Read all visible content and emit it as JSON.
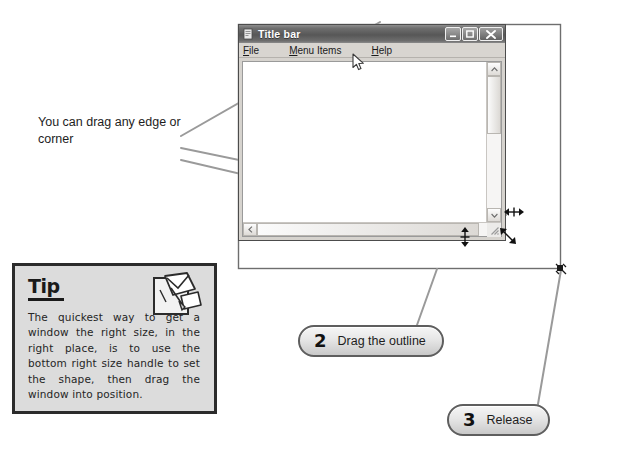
{
  "annotations": {
    "drag_note": "You can drag any edge or corner"
  },
  "window": {
    "title": "Title bar",
    "title_icon": "window-doc-icon",
    "controls": {
      "minimize": "minimize-icon",
      "maximize": "maximize-icon",
      "close": "close-icon"
    },
    "menu": [
      {
        "accel": "F",
        "rest": "ile",
        "name": "menu-file"
      },
      {
        "accel": "M",
        "rest": "enu Items",
        "name": "menu-items"
      },
      {
        "accel": "H",
        "rest": "elp",
        "name": "menu-help"
      }
    ],
    "scrollbars": {
      "vertical_up": "scroll-up-arrow",
      "vertical_down": "scroll-down-arrow",
      "horizontal_left": "scroll-left-arrow",
      "horizontal_right": "scroll-right-arrow",
      "grip": "resize-grip-icon"
    },
    "cursor": "mouse-pointer-arrow"
  },
  "resize_cursors": {
    "right_edge": "horizontal-resize-cursor",
    "bottom_edge": "vertical-resize-cursor",
    "corner": "diagonal-resize-cursor",
    "outline_corner": "diagonal-resize-cursor"
  },
  "drag_outline": {
    "label": "window-drag-outline"
  },
  "tip": {
    "heading": "Tip",
    "icon": "note-papers-icon",
    "body": "The quickest way to get a window the right size, in the right place, is to use the bottom right size handle to set the shape, then drag the window into position."
  },
  "steps": [
    {
      "number": "2",
      "label": "Drag the outline"
    },
    {
      "number": "3",
      "label": "Release"
    }
  ],
  "colors": {
    "line": "#8c8c8c",
    "outline": "#6e6e6e",
    "tip_bg": "#dcdcdc",
    "tip_border": "#2b2b2b",
    "titlebar": "#575757",
    "page_bg": "#ffffff"
  }
}
